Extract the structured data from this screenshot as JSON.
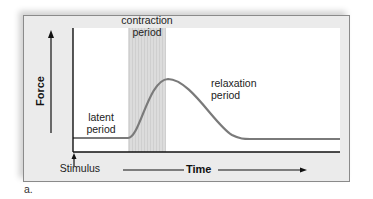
{
  "figure": {
    "sublabel": "a.",
    "y_axis_label": "Force",
    "x_axis_label": "Time",
    "stimulus_label": "Stimulus",
    "regions": {
      "latent": [
        "latent",
        "period"
      ],
      "contraction": [
        "contraction",
        "period"
      ],
      "relaxation": [
        "relaxation",
        "period"
      ]
    },
    "colors": {
      "frame_bg": "#ebebeb",
      "plot_bg": "#ffffff",
      "curve": "#7a7a7a",
      "contraction_band": "#d9d9d9",
      "axis": "#111111"
    }
  }
}
